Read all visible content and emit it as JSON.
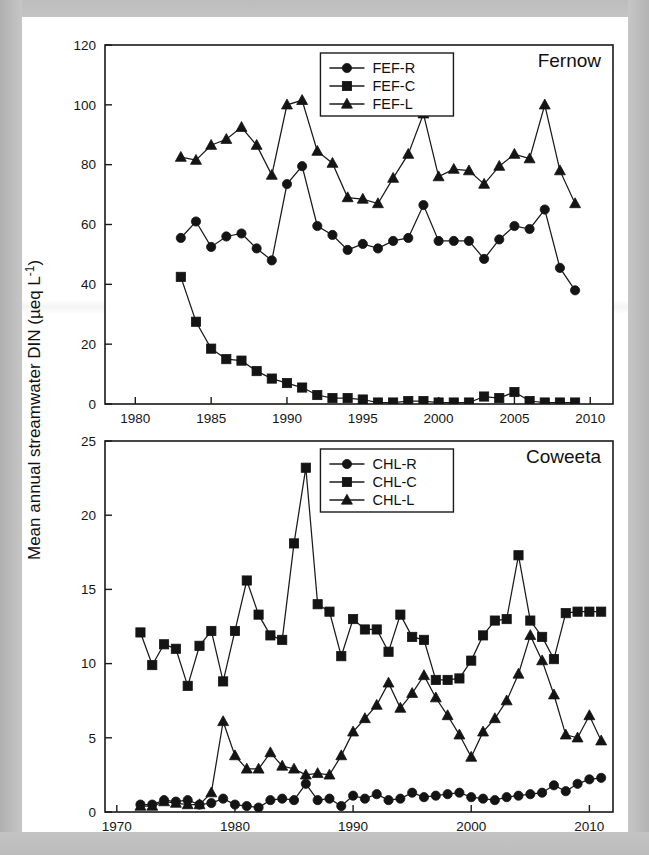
{
  "figure": {
    "ylabel": "Mean annual streamwater DIN (µeq L",
    "ylabel_sup": "-1",
    "ylabel_close": ")"
  },
  "chart_data": [
    {
      "type": "line",
      "title": "Fernow",
      "xlabel": "",
      "ylabel": "Mean annual streamwater DIN (µeq L⁻¹)",
      "xlim": [
        1978,
        2011.5
      ],
      "ylim": [
        0,
        120
      ],
      "xticks": [
        1980,
        1985,
        1990,
        1995,
        2000,
        2005,
        2010
      ],
      "yticks": [
        0,
        20,
        40,
        60,
        80,
        100,
        120
      ],
      "grid": false,
      "legend_position": "top-center",
      "series": [
        {
          "name": "FEF-R",
          "marker": "circle",
          "x": [
            1983,
            1984,
            1985,
            1986,
            1987,
            1988,
            1989,
            1990,
            1991,
            1992,
            1993,
            1994,
            1995,
            1996,
            1997,
            1998,
            1999,
            2000,
            2001,
            2002,
            2003,
            2004,
            2005,
            2006,
            2007,
            2008,
            2009
          ],
          "values": [
            55.5,
            61.0,
            52.5,
            56.0,
            57.0,
            52.0,
            48.0,
            73.5,
            79.5,
            59.5,
            56.5,
            51.5,
            53.5,
            52.0,
            54.5,
            55.5,
            66.5,
            54.5,
            54.5,
            54.5,
            48.5,
            55.0,
            59.5,
            58.5,
            65.0,
            45.5,
            38.0
          ]
        },
        {
          "name": "FEF-C",
          "marker": "square",
          "x": [
            1983,
            1984,
            1985,
            1986,
            1987,
            1988,
            1989,
            1990,
            1991,
            1992,
            1993,
            1994,
            1995,
            1996,
            1997,
            1998,
            1999,
            2000,
            2001,
            2002,
            2003,
            2004,
            2005,
            2006,
            2007,
            2008,
            2009
          ],
          "values": [
            42.5,
            27.5,
            18.5,
            15.0,
            14.5,
            11.0,
            8.5,
            7.0,
            5.5,
            3.0,
            2.0,
            2.0,
            1.5,
            0.5,
            0.5,
            1.0,
            1.0,
            0.5,
            0.5,
            0.5,
            2.5,
            2.0,
            4.0,
            1.0,
            0.5,
            0.5,
            0.5
          ]
        },
        {
          "name": "FEF-L",
          "marker": "triangle",
          "x": [
            1983,
            1984,
            1985,
            1986,
            1987,
            1988,
            1989,
            1990,
            1991,
            1992,
            1993,
            1994,
            1995,
            1996,
            1997,
            1998,
            1999,
            2000,
            2001,
            2002,
            2003,
            2004,
            2005,
            2006,
            2007,
            2008,
            2009
          ],
          "values": [
            82.5,
            81.5,
            86.5,
            88.5,
            92.5,
            86.5,
            76.5,
            100.0,
            101.5,
            84.5,
            80.5,
            69.0,
            68.5,
            67.0,
            75.5,
            83.5,
            97.0,
            76.0,
            78.5,
            78.0,
            73.5,
            79.5,
            83.5,
            82.0,
            100.0,
            78.0,
            67.0
          ]
        }
      ]
    },
    {
      "type": "line",
      "title": "Coweeta",
      "xlabel": "",
      "ylabel": "Mean annual streamwater DIN (µeq L⁻¹)",
      "xlim": [
        1969,
        2012
      ],
      "ylim": [
        0,
        25
      ],
      "xticks": [
        1970,
        1980,
        1990,
        2000,
        2010
      ],
      "yticks": [
        0,
        5,
        10,
        15,
        20,
        25
      ],
      "grid": false,
      "legend_position": "top-center",
      "series": [
        {
          "name": "CHL-R",
          "marker": "circle",
          "x": [
            1972,
            1973,
            1974,
            1975,
            1976,
            1977,
            1978,
            1979,
            1980,
            1981,
            1982,
            1983,
            1984,
            1985,
            1986,
            1987,
            1988,
            1989,
            1990,
            1991,
            1992,
            1993,
            1994,
            1995,
            1996,
            1997,
            1998,
            1999,
            2000,
            2001,
            2002,
            2003,
            2004,
            2005,
            2006,
            2007,
            2008,
            2009,
            2010,
            2011
          ],
          "values": [
            0.5,
            0.5,
            0.8,
            0.7,
            0.8,
            0.5,
            0.6,
            0.9,
            0.5,
            0.4,
            0.3,
            0.8,
            0.9,
            0.8,
            1.9,
            0.8,
            0.9,
            0.4,
            1.1,
            0.9,
            1.2,
            0.8,
            0.9,
            1.3,
            1.0,
            1.1,
            1.2,
            1.3,
            1.0,
            0.9,
            0.8,
            1.0,
            1.1,
            1.2,
            1.3,
            1.8,
            1.4,
            1.9,
            2.2,
            2.3
          ]
        },
        {
          "name": "CHL-C",
          "marker": "square",
          "x": [
            1972,
            1973,
            1974,
            1975,
            1976,
            1977,
            1978,
            1979,
            1980,
            1981,
            1982,
            1983,
            1984,
            1985,
            1986,
            1987,
            1988,
            1989,
            1990,
            1991,
            1992,
            1993,
            1994,
            1995,
            1996,
            1997,
            1998,
            1999,
            2000,
            2001,
            2002,
            2003,
            2004,
            2005,
            2006,
            2007,
            2008,
            2009,
            2010,
            2011
          ],
          "values": [
            12.1,
            9.9,
            11.3,
            11.0,
            8.5,
            11.2,
            12.2,
            8.8,
            12.2,
            15.6,
            13.3,
            11.9,
            11.6,
            18.1,
            23.2,
            14.0,
            13.5,
            10.5,
            13.0,
            12.3,
            12.3,
            10.8,
            13.3,
            11.8,
            11.6,
            8.9,
            8.9,
            9.0,
            10.2,
            11.9,
            12.9,
            13.0,
            17.3,
            12.9,
            11.8,
            10.3,
            13.4,
            13.5,
            13.5,
            13.5
          ]
        },
        {
          "name": "CHL-L",
          "marker": "triangle",
          "x": [
            1972,
            1973,
            1974,
            1975,
            1976,
            1977,
            1978,
            1979,
            1980,
            1981,
            1982,
            1983,
            1984,
            1985,
            1986,
            1987,
            1988,
            1989,
            1990,
            1991,
            1992,
            1993,
            1994,
            1995,
            1996,
            1997,
            1998,
            1999,
            2000,
            2001,
            2002,
            2003,
            2004,
            2005,
            2006,
            2007,
            2008,
            2009,
            2010,
            2011
          ],
          "values": [
            0.4,
            0.4,
            0.7,
            0.6,
            0.5,
            0.5,
            1.3,
            6.1,
            3.8,
            2.9,
            2.9,
            4.0,
            3.1,
            2.9,
            2.5,
            2.6,
            2.5,
            3.8,
            5.4,
            6.3,
            7.2,
            8.7,
            7.0,
            8.0,
            9.2,
            7.7,
            6.5,
            5.2,
            3.7,
            5.4,
            6.3,
            7.5,
            9.3,
            11.9,
            10.2,
            7.9,
            5.2,
            5.0,
            6.5,
            4.8
          ]
        }
      ]
    }
  ]
}
